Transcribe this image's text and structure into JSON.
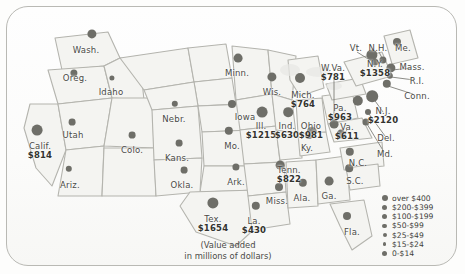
{
  "map": {
    "title": "United States value added by state",
    "caption_line1": "(Value added",
    "caption_line2": "in millions of dollars)",
    "states": [
      {
        "name": "Wash.",
        "value": "",
        "x": 86,
        "y": 46,
        "dx": 92,
        "dy": 34,
        "size": 4.6
      },
      {
        "name": "Oreg.",
        "value": "",
        "x": 75,
        "y": 74,
        "dx": 74,
        "dy": 73,
        "size": 3.6
      },
      {
        "name": "Idaho",
        "value": "",
        "x": 111,
        "y": 88,
        "dx": 112,
        "dy": 78,
        "size": 2.6
      },
      {
        "name": "Calif.",
        "value": "$814",
        "x": 40,
        "y": 142,
        "dx": 37,
        "dy": 130,
        "size": 5.4
      },
      {
        "name": "Utah",
        "value": "",
        "x": 73,
        "y": 131,
        "dx": 72,
        "dy": 122,
        "size": 3.4
      },
      {
        "name": "Ariz.",
        "value": "",
        "x": 70,
        "y": 181,
        "dx": 69,
        "dy": 169,
        "size": 3.2
      },
      {
        "name": "Colo.",
        "value": "",
        "x": 132,
        "y": 146,
        "dx": 132,
        "dy": 135,
        "size": 3.4
      },
      {
        "name": "Nebr.",
        "value": "",
        "x": 174,
        "y": 115,
        "dx": 175,
        "dy": 104,
        "size": 3.2
      },
      {
        "name": "Kans.",
        "value": "",
        "x": 177,
        "y": 154,
        "dx": 179,
        "dy": 143,
        "size": 3.4
      },
      {
        "name": "Okla.",
        "value": "",
        "x": 182,
        "y": 181,
        "dx": 184,
        "dy": 170,
        "size": 3.4
      },
      {
        "name": "Tex.",
        "value": "$1654",
        "x": 213,
        "y": 215,
        "dx": 213,
        "dy": 203,
        "size": 5.6
      },
      {
        "name": "Minn.",
        "value": "",
        "x": 237,
        "y": 69,
        "dx": 238,
        "dy": 58,
        "size": 4.4
      },
      {
        "name": "Iowa",
        "value": "",
        "x": 245,
        "y": 113,
        "dx": 232,
        "dy": 104,
        "size": 4.0
      },
      {
        "name": "Mo.",
        "value": "",
        "x": 232,
        "y": 142,
        "dx": 229,
        "dy": 131,
        "size": 4.2
      },
      {
        "name": "Wis.",
        "value": "",
        "x": 272,
        "y": 88,
        "dx": 272,
        "dy": 77,
        "size": 4.6
      },
      {
        "name": "Ark.",
        "value": "",
        "x": 236,
        "y": 178,
        "dx": 236,
        "dy": 167,
        "size": 3.6
      },
      {
        "name": "La.",
        "value": "$430",
        "x": 254,
        "y": 217,
        "dx": 256,
        "dy": 206,
        "size": 4.2
      },
      {
        "name": "Miss.",
        "value": "",
        "x": 277,
        "y": 197,
        "dx": 279,
        "dy": 187,
        "size": 4.0
      },
      {
        "name": "Ala.",
        "value": "",
        "x": 302,
        "y": 194,
        "dx": 303,
        "dy": 183,
        "size": 4.2
      },
      {
        "name": "Tenn.",
        "value": "$822",
        "x": 289,
        "y": 166,
        "dx": 280,
        "dy": 165,
        "size": 4.4
      },
      {
        "name": "Ga.",
        "value": "",
        "x": 329,
        "y": 192,
        "dx": 329,
        "dy": 181,
        "size": 4.4
      },
      {
        "name": "Fla.",
        "value": "",
        "x": 352,
        "y": 228,
        "dx": 347,
        "dy": 216,
        "size": 4.0
      },
      {
        "name": "S.C.",
        "value": "",
        "x": 355,
        "y": 177,
        "dx": 349,
        "dy": 168,
        "size": 3.8
      },
      {
        "name": "N.C.",
        "value": "",
        "x": 358,
        "y": 159,
        "dx": 350,
        "dy": 152,
        "size": 4.2
      },
      {
        "name": "Ill.",
        "value": "$1215",
        "x": 261,
        "y": 122,
        "dx": 262,
        "dy": 112,
        "size": 5.4
      },
      {
        "name": "Ind.",
        "value": "$630",
        "x": 287,
        "y": 122,
        "dx": 288,
        "dy": 112,
        "size": 4.8
      },
      {
        "name": "Ohio",
        "value": "$981",
        "x": 311,
        "y": 122,
        "dx": 312,
        "dy": 132,
        "size": 5.2
      },
      {
        "name": "Mich.",
        "value": "$764",
        "x": 303,
        "y": 91,
        "dx": 300,
        "dy": 78,
        "size": 5.0
      },
      {
        "name": "Ky.",
        "value": "",
        "x": 307,
        "y": 144,
        "dx": 309,
        "dy": 135,
        "size": 4.0
      },
      {
        "name": "W.Va.",
        "value": "$781",
        "x": 333,
        "y": 64,
        "dx": 334,
        "dy": 124,
        "size": 4.4
      },
      {
        "name": "Pa.",
        "value": "$963",
        "x": 340,
        "y": 104,
        "dx": 358,
        "dy": 101,
        "size": 5.2
      },
      {
        "name": "Vt.",
        "value": "",
        "x": 356,
        "y": 44,
        "dx": 375,
        "dy": 62,
        "size": 3.6
      },
      {
        "name": "N.H.",
        "value": "",
        "x": 378,
        "y": 44,
        "dx": 383,
        "dy": 60,
        "size": 3.6
      },
      {
        "name": "Me.",
        "value": "",
        "x": 403,
        "y": 44,
        "dx": 397,
        "dy": 42,
        "size": 4.0
      },
      {
        "name": "N.Y.",
        "value": "$1358",
        "x": 375,
        "y": 60,
        "dx": 372,
        "dy": 55,
        "size": 5.6
      },
      {
        "name": "Mass.",
        "value": "",
        "x": 412,
        "y": 63,
        "dx": 391,
        "dy": 68,
        "size": 4.6
      },
      {
        "name": "R.I.",
        "value": "",
        "x": 417,
        "y": 77,
        "dx": 390,
        "dy": 76,
        "size": 3.2
      },
      {
        "name": "Conn.",
        "value": "",
        "x": 417,
        "y": 92,
        "dx": 387,
        "dy": 84,
        "size": 4.2
      },
      {
        "name": "N.J.",
        "value": "$2120",
        "x": 383,
        "y": 107,
        "dx": 372,
        "dy": 96,
        "size": 5.8
      },
      {
        "name": "Del.",
        "value": "",
        "x": 386,
        "y": 134,
        "dx": 368,
        "dy": 112,
        "size": 3.0
      },
      {
        "name": "Md.",
        "value": "",
        "x": 385,
        "y": 150,
        "dx": 366,
        "dy": 122,
        "size": 3.6
      },
      {
        "name": "Va.",
        "value": "$611",
        "x": 347,
        "y": 123,
        "dx": 341,
        "dy": 134,
        "size": 4.4
      }
    ],
    "leaders": [
      {
        "x1": 334,
        "y1": 74,
        "x2": 334,
        "y2": 122
      },
      {
        "x1": 357,
        "y1": 52,
        "x2": 373,
        "y2": 62
      },
      {
        "x1": 379,
        "y1": 52,
        "x2": 383,
        "y2": 60
      },
      {
        "x1": 411,
        "y1": 68,
        "x2": 392,
        "y2": 70
      },
      {
        "x1": 414,
        "y1": 80,
        "x2": 391,
        "y2": 77
      },
      {
        "x1": 413,
        "y1": 94,
        "x2": 388,
        "y2": 86
      },
      {
        "x1": 383,
        "y1": 112,
        "x2": 373,
        "y2": 98
      },
      {
        "x1": 385,
        "y1": 136,
        "x2": 369,
        "y2": 114
      },
      {
        "x1": 384,
        "y1": 152,
        "x2": 367,
        "y2": 124
      },
      {
        "x1": 347,
        "y1": 130,
        "x2": 342,
        "y2": 136
      }
    ]
  },
  "legend": {
    "title": "Value added ranges",
    "items": [
      {
        "label": "over $400",
        "size": 6.0
      },
      {
        "label": "$200-$399",
        "size": 5.2
      },
      {
        "label": "$100-$199",
        "size": 5.6
      },
      {
        "label": "$50-$99",
        "size": 4.4
      },
      {
        "label": "$25-$49",
        "size": 4.0
      },
      {
        "label": "$15-$24",
        "size": 3.6
      },
      {
        "label": "0-$14",
        "size": 5.0
      }
    ]
  },
  "colors": {
    "dot": "#6e6e68",
    "text": "#4a4a46",
    "value_text": "#33332f",
    "state_fill": "#f2f2ef",
    "state_border": "#b6b6b0",
    "card_border": "#b9b9b4",
    "background": "#fdfdfc"
  },
  "chart_data": {
    "type": "map",
    "unit": "millions of dollars",
    "labeled_values": [
      {
        "state": "N.J.",
        "value": 2120
      },
      {
        "state": "Tex.",
        "value": 1654
      },
      {
        "state": "N.Y.",
        "value": 1358
      },
      {
        "state": "Ill.",
        "value": 1215
      },
      {
        "state": "Ohio",
        "value": 981
      },
      {
        "state": "Pa.",
        "value": 963
      },
      {
        "state": "Tenn.",
        "value": 822
      },
      {
        "state": "Calif.",
        "value": 814
      },
      {
        "state": "W.Va.",
        "value": 781
      },
      {
        "state": "Mich.",
        "value": 764
      },
      {
        "state": "Ind.",
        "value": 630
      },
      {
        "state": "Va.",
        "value": 611
      },
      {
        "state": "La.",
        "value": 430
      }
    ],
    "legend_bins": [
      "over $400",
      "$200-$399",
      "$100-$199",
      "$50-$99",
      "$25-$49",
      "$15-$24",
      "0-$14"
    ],
    "legend_position": "bottom-right"
  }
}
